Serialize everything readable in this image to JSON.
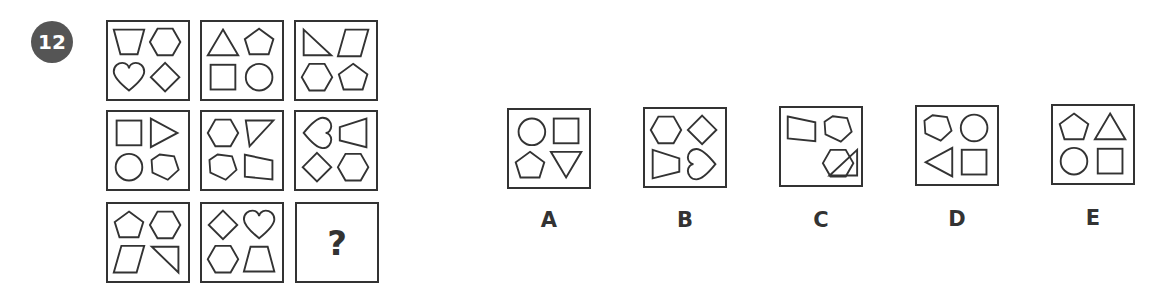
{
  "question_number": "12",
  "missing_symbol": "?",
  "grid": [
    {
      "row": 1,
      "col": 1,
      "shapes": [
        "trapezoid-inverted",
        "hexagon",
        "heart",
        "diamond"
      ]
    },
    {
      "row": 1,
      "col": 2,
      "shapes": [
        "triangle",
        "pentagon",
        "square",
        "circle"
      ]
    },
    {
      "row": 1,
      "col": 3,
      "shapes": [
        "right-triangle",
        "parallelogram",
        "hexagon",
        "pentagon"
      ]
    },
    {
      "row": 2,
      "col": 1,
      "shapes": [
        "square",
        "triangle-right",
        "circle",
        "pentagon-rotated"
      ]
    },
    {
      "row": 2,
      "col": 2,
      "shapes": [
        "hexagon",
        "right-triangle-down",
        "pentagon-rotated",
        "trapezoid-rotated"
      ]
    },
    {
      "row": 2,
      "col": 3,
      "shapes": [
        "heart-left",
        "trapezoid-left",
        "diamond",
        "hexagon"
      ]
    },
    {
      "row": 3,
      "col": 1,
      "shapes": [
        "pentagon",
        "hexagon",
        "parallelogram",
        "right-triangle-down"
      ]
    },
    {
      "row": 3,
      "col": 2,
      "shapes": [
        "diamond",
        "heart",
        "hexagon",
        "trapezoid"
      ]
    },
    {
      "row": 3,
      "col": 3,
      "shapes": [
        "?"
      ]
    }
  ],
  "options": [
    {
      "label": "A",
      "shapes": [
        "circle",
        "square",
        "pentagon",
        "triangle-down"
      ]
    },
    {
      "label": "B",
      "shapes": [
        "hexagon",
        "diamond",
        "trapezoid-right",
        "heart-right"
      ]
    },
    {
      "label": "C",
      "shapes": [
        "trapezoid-rotated",
        "pentagon-rotated",
        "right-triangle",
        "hexagon"
      ]
    },
    {
      "label": "D",
      "shapes": [
        "pentagon-rotated",
        "circle",
        "triangle-left",
        "square"
      ]
    },
    {
      "label": "E",
      "shapes": [
        "pentagon",
        "triangle",
        "circle",
        "square"
      ]
    }
  ]
}
